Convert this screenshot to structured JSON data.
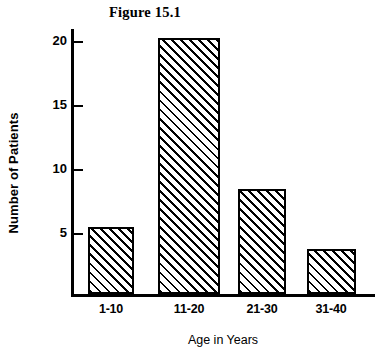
{
  "figure": {
    "title": "Figure 15.1"
  },
  "chart_data": {
    "type": "bar",
    "title": "Figure 15.1",
    "xlabel": "Age in Years",
    "ylabel": "Number of Patients",
    "categories": [
      "1-10",
      "11-20",
      "21-30",
      "31-40"
    ],
    "values": [
      5.2,
      20,
      8.2,
      3.5
    ],
    "ylim": [
      0,
      21
    ],
    "yticks": [
      5,
      10,
      15,
      20
    ],
    "ytick_labels": [
      "5",
      "10",
      "15",
      "20"
    ],
    "grid": false,
    "legend": null,
    "bar_fill": "diagonal-hatch",
    "colors": {
      "axis": "#000000",
      "bar_edge": "#000000",
      "bar_hatch": "#000000",
      "bar_background": "#ffffff",
      "page_background": "#ffffff"
    }
  }
}
